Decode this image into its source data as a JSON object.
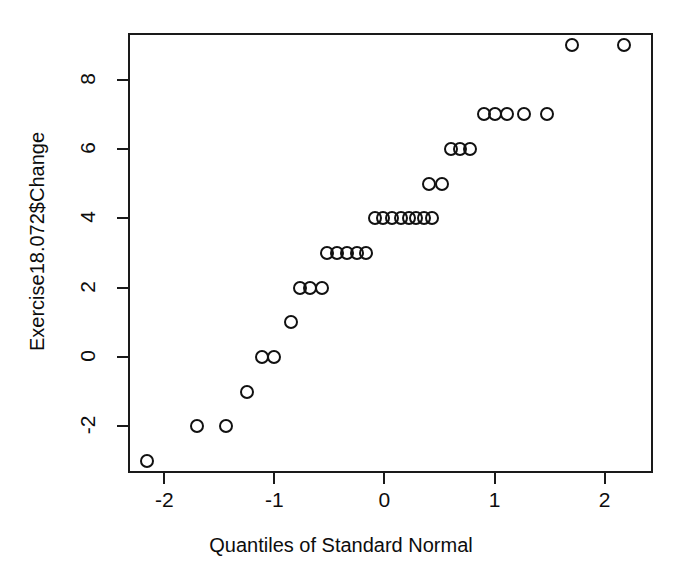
{
  "chart_data": {
    "type": "scatter",
    "title": "",
    "xlabel": "Quantiles of Standard Normal",
    "ylabel": "Exercise18.072$Change",
    "xlim": [
      -2.33,
      2.44
    ],
    "ylim": [
      -3.35,
      9.35
    ],
    "xticks": [
      -2,
      -1,
      0,
      1,
      2
    ],
    "xticklabels": [
      "-2",
      "-1",
      "0",
      "1",
      "2"
    ],
    "yticks": [
      -2,
      0,
      2,
      4,
      6,
      8
    ],
    "yticklabels": [
      "-2",
      "0",
      "2",
      "4",
      "6",
      "8"
    ],
    "grid": false,
    "legend": null,
    "marker": "open-circle",
    "marker_color": "#111111",
    "frame": "box",
    "n_points": 33,
    "points": [
      {
        "x": -2.16,
        "y": -3
      },
      {
        "x": -1.7,
        "y": -2
      },
      {
        "x": -1.44,
        "y": -2
      },
      {
        "x": -1.25,
        "y": -1
      },
      {
        "x": -1.11,
        "y": 0
      },
      {
        "x": -1.0,
        "y": 0
      },
      {
        "x": -0.85,
        "y": 1
      },
      {
        "x": -0.77,
        "y": 2
      },
      {
        "x": -0.68,
        "y": 2
      },
      {
        "x": -0.57,
        "y": 2
      },
      {
        "x": -0.52,
        "y": 3
      },
      {
        "x": -0.43,
        "y": 3
      },
      {
        "x": -0.34,
        "y": 3
      },
      {
        "x": -0.25,
        "y": 3
      },
      {
        "x": -0.17,
        "y": 3
      },
      {
        "x": -0.09,
        "y": 4
      },
      {
        "x": -0.01,
        "y": 4
      },
      {
        "x": 0.07,
        "y": 4
      },
      {
        "x": 0.15,
        "y": 4
      },
      {
        "x": 0.22,
        "y": 4
      },
      {
        "x": 0.29,
        "y": 4
      },
      {
        "x": 0.36,
        "y": 4
      },
      {
        "x": 0.43,
        "y": 4
      },
      {
        "x": 0.4,
        "y": 5
      },
      {
        "x": 0.52,
        "y": 5
      },
      {
        "x": 0.6,
        "y": 6
      },
      {
        "x": 0.69,
        "y": 6
      },
      {
        "x": 0.78,
        "y": 6
      },
      {
        "x": 0.9,
        "y": 7
      },
      {
        "x": 1.0,
        "y": 7
      },
      {
        "x": 1.11,
        "y": 7
      },
      {
        "x": 1.27,
        "y": 7
      },
      {
        "x": 1.48,
        "y": 7
      },
      {
        "x": 1.7,
        "y": 9
      },
      {
        "x": 2.18,
        "y": 9
      }
    ]
  }
}
